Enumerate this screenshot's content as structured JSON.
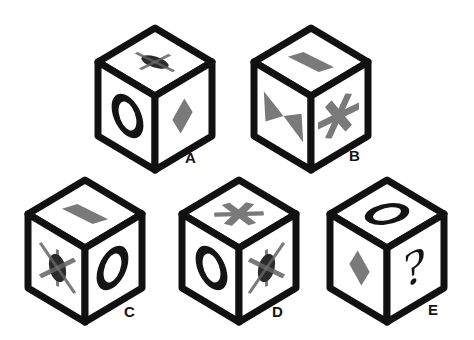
{
  "page": {
    "background_color": "#ffffff",
    "width": 474,
    "height": 340
  },
  "style": {
    "cube_edge_color": "#111111",
    "cube_face_color": "#ffffff",
    "symbol_gray": "#7a7a7a",
    "symbol_dark": "#2b2b2b",
    "symbol_black": "#141414",
    "label_color": "#141414",
    "edge_width": 7
  },
  "symbols": {
    "crossed_ellipse_horizontal": {
      "name": "crossed-ellipse-horizontal",
      "description": "horizontal dark ellipse overlaid by a light gray plus-shaped cross"
    },
    "crossed_ellipse_diagonal": {
      "name": "crossed-ellipse-diagonal",
      "description": "vertical dark ellipse overlaid by a light gray diagonal X cross"
    },
    "ring": {
      "name": "ring-oval",
      "description": "thick black oval outline, like the letter O"
    },
    "diamond": {
      "name": "diamond-rhombus",
      "description": "solid gray rhombus / diamond"
    },
    "parallelogram": {
      "name": "parallelogram",
      "description": "solid gray slanted parallelogram"
    },
    "bowtie": {
      "name": "bowtie-hourglass",
      "description": "solid gray bowtie of two triangles meeting at a center point"
    },
    "asterisk": {
      "name": "asterisk-star",
      "description": "solid gray six-armed asterisk star"
    },
    "question_mark": {
      "name": "question-mark",
      "description": "black question mark glyph"
    }
  },
  "cubes": [
    {
      "id": "A",
      "label": "A",
      "label_text": "A",
      "position": {
        "left": 96,
        "top": 26
      },
      "label_position": {
        "left": 185,
        "top": 150
      },
      "faces": {
        "top": "crossed_ellipse_horizontal",
        "left": "ring",
        "right": "diamond"
      },
      "face_symbol_names": {
        "top": "crossed-ellipse-horizontal",
        "left": "ring-oval",
        "right": "diamond-rhombus"
      }
    },
    {
      "id": "B",
      "label": "B",
      "label_text": "B",
      "position": {
        "left": 252,
        "top": 26
      },
      "label_position": {
        "left": 349,
        "top": 148
      },
      "faces": {
        "top": "parallelogram",
        "left": "bowtie",
        "right": "asterisk"
      },
      "face_symbol_names": {
        "top": "parallelogram",
        "left": "bowtie-hourglass",
        "right": "asterisk-star"
      }
    },
    {
      "id": "C",
      "label": "C",
      "label_text": "C",
      "position": {
        "left": 26,
        "top": 178
      },
      "label_position": {
        "left": 124,
        "top": 304
      },
      "faces": {
        "top": "parallelogram",
        "left": "crossed_ellipse_diagonal",
        "right": "ring"
      },
      "face_symbol_names": {
        "top": "parallelogram",
        "left": "crossed-ellipse-diagonal",
        "right": "ring-oval"
      }
    },
    {
      "id": "D",
      "label": "D",
      "label_text": "D",
      "position": {
        "left": 180,
        "top": 178
      },
      "label_position": {
        "left": 272,
        "top": 304
      },
      "faces": {
        "top": "asterisk",
        "left": "ring",
        "right": "crossed_ellipse_diagonal"
      },
      "face_symbol_names": {
        "top": "asterisk-star",
        "left": "ring-oval",
        "right": "crossed-ellipse-diagonal"
      }
    },
    {
      "id": "E",
      "label": "E",
      "label_text": "E",
      "position": {
        "left": 328,
        "top": 178
      },
      "label_position": {
        "left": 428,
        "top": 302
      },
      "faces": {
        "top": "ring",
        "left": "diamond",
        "right": "question_mark"
      },
      "face_symbol_names": {
        "top": "ring-oval",
        "left": "diamond-rhombus",
        "right": "question-mark"
      }
    }
  ]
}
